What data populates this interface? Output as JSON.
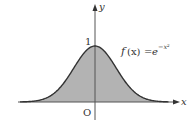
{
  "chart_data": {
    "type": "area",
    "title": "",
    "function_label": "f(x) = e^{-x^2}",
    "function_parts": {
      "f": "f",
      "arg": "(x)",
      "eq": "=",
      "base": "e",
      "exp": "−x²"
    },
    "xlabel": "x",
    "ylabel": "y",
    "origin_label": "O",
    "y_tick_labels": [
      "1"
    ],
    "x": [
      -2.5,
      -2.0,
      -1.5,
      -1.0,
      -0.5,
      0,
      0.5,
      1.0,
      1.5,
      2.0,
      2.5
    ],
    "values": [
      0.002,
      0.018,
      0.105,
      0.368,
      0.779,
      1.0,
      0.779,
      0.368,
      0.105,
      0.018,
      0.002
    ],
    "xlim": [
      -2.5,
      2.9
    ],
    "ylim": [
      -0.3,
      1.75
    ],
    "grid": false,
    "legend": "none",
    "fill_color": "#b3b3b3",
    "curve_color": "#333333",
    "axis_color": "#555555"
  }
}
